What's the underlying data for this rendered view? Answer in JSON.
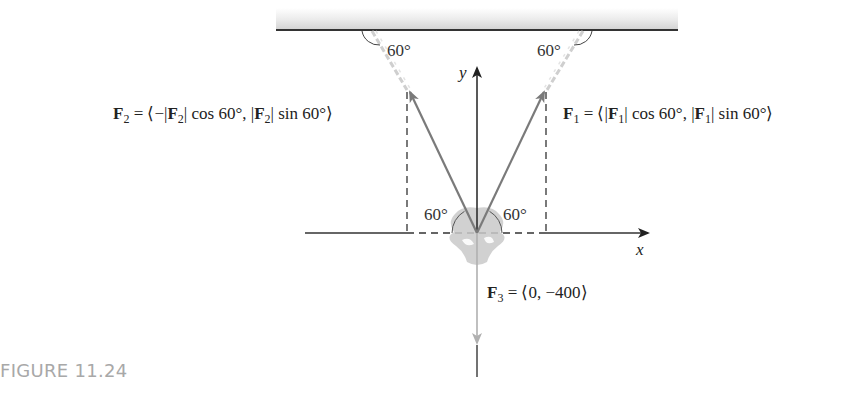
{
  "figure": {
    "caption": "FIGURE 11.24"
  },
  "axes": {
    "x_label": "x",
    "y_label": "y"
  },
  "angles": {
    "top_left": "60°",
    "top_right": "60°",
    "bottom_left": "60°",
    "bottom_right": "60°"
  },
  "forces": {
    "f1": {
      "name": "F",
      "sub": "1",
      "eq": " = ⟨|",
      "mid1": "| cos 60°, |",
      "mid2": "| sin 60°⟩"
    },
    "f2": {
      "name": "F",
      "sub": "2",
      "eq": " = ⟨−|",
      "mid1": "| cos 60°, |",
      "mid2": "| sin 60°⟩"
    },
    "f3": {
      "name": "F",
      "sub": "3",
      "eq": " = ⟨0, −400⟩"
    }
  },
  "colors": {
    "axis": "#222222",
    "force_arrow": "#7a7a7a",
    "chain": "#cfcfcf",
    "ceiling_line": "#333333",
    "caption": "#a8a8a8"
  }
}
